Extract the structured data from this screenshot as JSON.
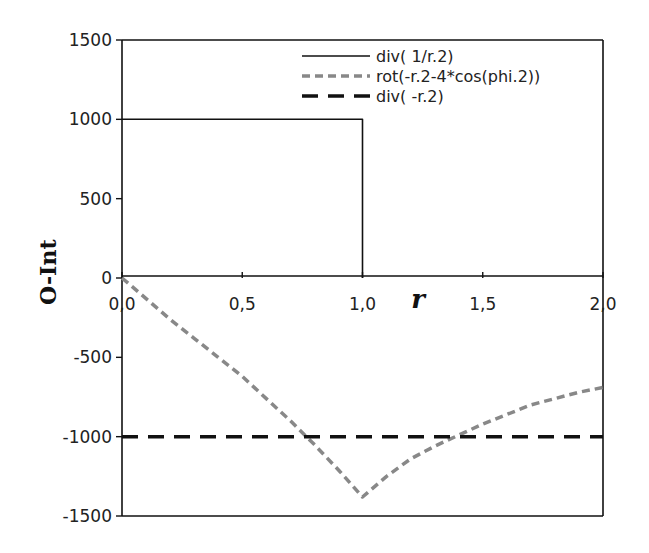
{
  "chart_data": {
    "type": "line",
    "title": "",
    "xlabel": "r",
    "ylabel": "O-Int",
    "xlim": [
      0.0,
      2.0
    ],
    "ylim": [
      -1500,
      1500
    ],
    "x_ticks": [
      "0,0",
      "0,5",
      "1,0",
      "1,5",
      "2,0"
    ],
    "y_ticks": [
      "1500",
      "1000",
      "500",
      "0",
      "-500",
      "-1000",
      "-1500"
    ],
    "grid": false,
    "legend_position": "top-right inside",
    "series": [
      {
        "name": "div( 1/r.2)",
        "style": "solid",
        "color": "#111111",
        "x": [
          0.0,
          1.0,
          1.0,
          1.0
        ],
        "y": [
          1000,
          1000,
          500,
          0
        ]
      },
      {
        "name": "rot(-r.2-4*cos(phi.2))",
        "style": "dotted",
        "color": "#888888",
        "x": [
          0.0,
          0.1,
          0.2,
          0.3,
          0.4,
          0.5,
          0.6,
          0.7,
          0.8,
          0.9,
          1.0,
          1.1,
          1.2,
          1.3,
          1.4,
          1.5,
          1.6,
          1.7,
          1.8,
          1.9,
          2.0
        ],
        "y": [
          0,
          -130,
          -260,
          -380,
          -500,
          -620,
          -760,
          -900,
          -1050,
          -1210,
          -1380,
          -1250,
          -1140,
          -1060,
          -990,
          -920,
          -860,
          -800,
          -760,
          -720,
          -690
        ]
      },
      {
        "name": "div( -r.2)",
        "style": "dashed",
        "color": "#111111",
        "x": [
          0.0,
          2.0
        ],
        "y": [
          -1000,
          -1000
        ]
      }
    ]
  }
}
